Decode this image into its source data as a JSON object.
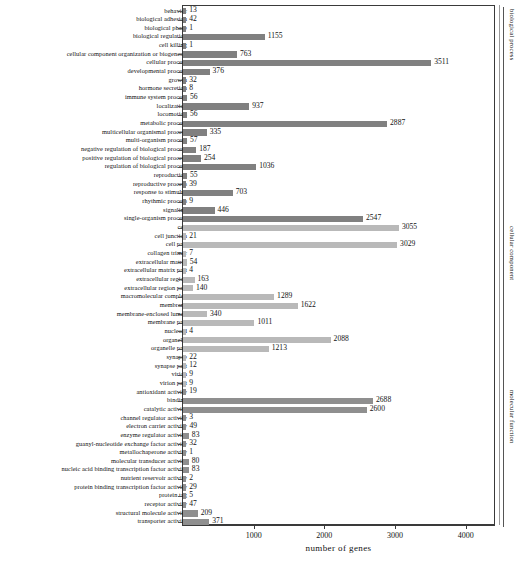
{
  "chart_data": {
    "type": "bar",
    "title": "",
    "xlabel": "number of genes",
    "ylabel": "",
    "xlim": [
      0,
      4400
    ],
    "orientation": "horizontal",
    "grid": false,
    "xticks": [
      1000,
      2000,
      3000,
      4000
    ],
    "categories": [
      "behavior",
      "biological adhesion",
      "biological phase",
      "biological regulation",
      "cell killing",
      "cellular component organization or biogenesis",
      "cellular process",
      "developmental process",
      "growth",
      "hormone secretion",
      "immune system process",
      "localization",
      "locomotion",
      "metabolic process",
      "multicellular organismal process",
      "multi-organism process",
      "negative regulation of biological process",
      "positive regulation of biological process",
      "regulation of biological process",
      "reproduction",
      "reproductive process",
      "response to stimulus",
      "rhythmic process",
      "signaling",
      "single-organism process",
      "cell",
      "cell junction",
      "cell part",
      "collagen trimer",
      "extracellular matrix",
      "extracellular matrix part",
      "extracellular region",
      "extracellular region part",
      "macromolecular complex",
      "membrane",
      "membrane-enclosed lumen",
      "membrane part",
      "nucleoid",
      "organelle",
      "organelle part",
      "synapse",
      "synapse part",
      "virion",
      "virion part",
      "antioxidant activity",
      "binding",
      "catalytic activity",
      "channel regulator activity",
      "electron carrier activity",
      "enzyme regulator activity",
      "guanyl-nucleotide exchange factor activity",
      "metallochaperone activity",
      "molecular transducer activity",
      "nucleic acid binding transcription factor activity",
      "nutrient reservoir activity",
      "protein binding transcription factor activity",
      "protein tag",
      "receptor activity",
      "structural molecule activity",
      "transporter activity"
    ],
    "values": [
      13,
      42,
      1,
      1155,
      1,
      763,
      3511,
      376,
      32,
      8,
      56,
      937,
      56,
      2887,
      335,
      57,
      187,
      254,
      1036,
      55,
      39,
      703,
      9,
      446,
      2547,
      3055,
      21,
      3029,
      7,
      54,
      4,
      163,
      140,
      1289,
      1622,
      340,
      1011,
      4,
      2088,
      1213,
      22,
      12,
      9,
      9,
      19,
      2688,
      2600,
      3,
      49,
      83,
      32,
      1,
      80,
      83,
      2,
      29,
      5,
      47,
      209,
      371
    ],
    "groups": [
      {
        "name": "biological process",
        "start": 0,
        "end": 24,
        "color": "#808080"
      },
      {
        "name": "cellular component",
        "start": 25,
        "end": 43,
        "color": "#b9b9b9"
      },
      {
        "name": "molecular function",
        "start": 44,
        "end": 59,
        "color": "#8f8f8f"
      }
    ]
  },
  "caption": ""
}
